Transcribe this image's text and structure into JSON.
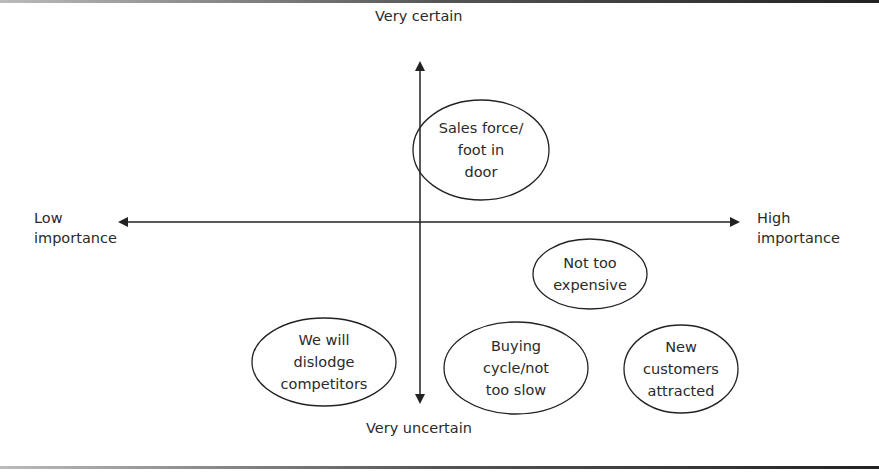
{
  "axes": {
    "top_label": "Very certain",
    "bottom_label": "Very uncertain",
    "left_label": [
      "Low",
      "importance"
    ],
    "right_label": [
      "High",
      "importance"
    ]
  },
  "nodes": [
    {
      "id": "sales-force",
      "lines": [
        "Sales force/",
        "foot in",
        "door"
      ],
      "cx": 481,
      "cy": 150,
      "rx": 68,
      "ry": 50
    },
    {
      "id": "not-too-expensive",
      "lines": [
        "Not too",
        "expensive"
      ],
      "cx": 590,
      "cy": 274,
      "rx": 57,
      "ry": 35
    },
    {
      "id": "dislodge-competitors",
      "lines": [
        "We will",
        "dislodge",
        "competitors"
      ],
      "cx": 324,
      "cy": 362,
      "rx": 72,
      "ry": 44
    },
    {
      "id": "buying-cycle",
      "lines": [
        "Buying",
        "cycle/not",
        "too slow"
      ],
      "cx": 516,
      "cy": 368,
      "rx": 72,
      "ry": 46
    },
    {
      "id": "new-customers",
      "lines": [
        "New",
        "customers",
        "attracted"
      ],
      "cx": 681,
      "cy": 369,
      "rx": 57,
      "ry": 44
    }
  ],
  "colors": {
    "line": "#222222",
    "text": "#2a2a2a",
    "background": "#ffffff"
  }
}
